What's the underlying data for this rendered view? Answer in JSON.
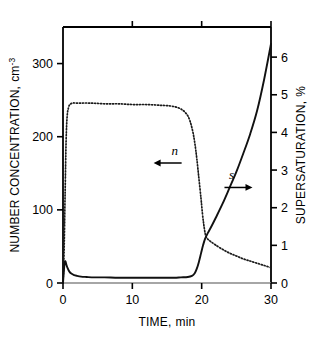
{
  "chart_data": {
    "type": "line",
    "title": "",
    "xlabel_name": "TIME",
    "xlabel_unit": "min",
    "xlabel": "TIME,  min",
    "ylabel_left_name": "NUMBER CONCENTRATION",
    "ylabel_left_unit": "cm",
    "ylabel_left_unit_exp": "-3",
    "ylabel_left": "NUMBER CONCENTRATION,  cm-3",
    "ylabel_right_name": "SUPERSATURATION",
    "ylabel_right_unit": "%",
    "ylabel_right": "SUPERSATURATION,  %",
    "xlim": [
      0,
      30
    ],
    "ylim_left": [
      0,
      350
    ],
    "ylim_right": [
      0,
      6.8
    ],
    "xticks": [
      "0",
      "10",
      "20",
      "30"
    ],
    "xtick_values": [
      0,
      10,
      20,
      30
    ],
    "yticks_left": [
      "0",
      "100",
      "200",
      "300"
    ],
    "ytick_values_left": [
      0,
      100,
      200,
      300
    ],
    "yticks_right": [
      "0",
      "1",
      "2",
      "3",
      "4",
      "5",
      "6"
    ],
    "ytick_values_right": [
      0,
      1,
      2,
      3,
      4,
      5,
      6
    ],
    "grid": false,
    "legend_position": "inline-arrows",
    "series": [
      {
        "name": "n",
        "label": "n",
        "axis": "left",
        "style": "dotted",
        "color": "#1a1a1a",
        "arrow_direction": "left",
        "label_x": 16.1,
        "label_y_left": 175,
        "points": [
          [
            0.0,
            0
          ],
          [
            0.15,
            40
          ],
          [
            0.3,
            120
          ],
          [
            0.45,
            195
          ],
          [
            0.6,
            228
          ],
          [
            0.8,
            240
          ],
          [
            1.0,
            244
          ],
          [
            1.4,
            246
          ],
          [
            2.0,
            246
          ],
          [
            4.0,
            246
          ],
          [
            6.0,
            245
          ],
          [
            8.0,
            245
          ],
          [
            10.0,
            244
          ],
          [
            12.0,
            244
          ],
          [
            14.0,
            243
          ],
          [
            15.5,
            242
          ],
          [
            16.5,
            240
          ],
          [
            17.3,
            236
          ],
          [
            17.9,
            230
          ],
          [
            18.3,
            222
          ],
          [
            18.7,
            208
          ],
          [
            19.0,
            192
          ],
          [
            19.3,
            170
          ],
          [
            19.6,
            143
          ],
          [
            19.9,
            116
          ],
          [
            20.1,
            96
          ],
          [
            20.3,
            80
          ],
          [
            20.5,
            68
          ],
          [
            20.7,
            62
          ],
          [
            21.0,
            59
          ],
          [
            21.4,
            56
          ],
          [
            22.0,
            52
          ],
          [
            23.0,
            46
          ],
          [
            24.0,
            41
          ],
          [
            25.0,
            37
          ],
          [
            26.0,
            33
          ],
          [
            27.0,
            30
          ],
          [
            28.0,
            27
          ],
          [
            29.0,
            24
          ],
          [
            30.0,
            21
          ]
        ]
      },
      {
        "name": "s",
        "label": "s",
        "axis": "right",
        "style": "solid",
        "color": "#111111",
        "arrow_direction": "right",
        "label_x": 24.3,
        "label_y_right": 2.75,
        "points": [
          [
            0.0,
            0.0
          ],
          [
            0.1,
            0.25
          ],
          [
            0.2,
            0.48
          ],
          [
            0.3,
            0.58
          ],
          [
            0.4,
            0.55
          ],
          [
            0.5,
            0.48
          ],
          [
            0.7,
            0.38
          ],
          [
            0.9,
            0.31
          ],
          [
            1.2,
            0.25
          ],
          [
            1.6,
            0.21
          ],
          [
            2.0,
            0.19
          ],
          [
            2.6,
            0.17
          ],
          [
            3.4,
            0.16
          ],
          [
            4.5,
            0.15
          ],
          [
            6.0,
            0.15
          ],
          [
            8.0,
            0.14
          ],
          [
            10.0,
            0.14
          ],
          [
            12.0,
            0.14
          ],
          [
            14.0,
            0.14
          ],
          [
            16.0,
            0.14
          ],
          [
            17.0,
            0.15
          ],
          [
            18.0,
            0.16
          ],
          [
            18.6,
            0.19
          ],
          [
            19.0,
            0.26
          ],
          [
            19.3,
            0.38
          ],
          [
            19.6,
            0.56
          ],
          [
            19.9,
            0.78
          ],
          [
            20.2,
            1.0
          ],
          [
            20.5,
            1.18
          ],
          [
            20.9,
            1.33
          ],
          [
            21.4,
            1.5
          ],
          [
            22.0,
            1.72
          ],
          [
            23.0,
            2.1
          ],
          [
            24.0,
            2.52
          ],
          [
            25.0,
            2.95
          ],
          [
            26.0,
            3.44
          ],
          [
            27.0,
            3.96
          ],
          [
            28.0,
            4.58
          ],
          [
            29.0,
            5.4
          ],
          [
            30.0,
            6.35
          ]
        ]
      }
    ]
  },
  "figure": {
    "background_color": "#ffffff",
    "axis_color": "#000000",
    "border_color": "#b9b9b9"
  }
}
